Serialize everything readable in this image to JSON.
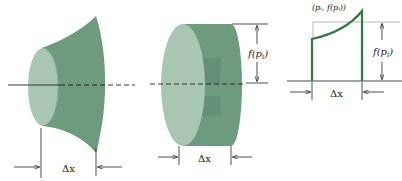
{
  "figure": {
    "panels": [
      {
        "id": "frustum",
        "label_width": "Δx"
      },
      {
        "id": "disk",
        "label_width": "Δx",
        "label_radius": "f(p_i)"
      },
      {
        "id": "strip",
        "label_width": "Δx",
        "label_height": "f(p_i)",
        "label_point": "(p_i, f(p_i))"
      }
    ],
    "labels": {
      "dx": "Δx",
      "radius_f": "f(",
      "radius_p": "p",
      "radius_i": "i",
      "radius_close": ")",
      "point": "(pᵢ, f(pᵢ))"
    },
    "colors": {
      "solid_body": "#6e9a7e",
      "solid_face": "#a9c6b3",
      "solid_dark": "#4f7d62",
      "curve": "#2e7a3e",
      "line": "#222222"
    }
  }
}
